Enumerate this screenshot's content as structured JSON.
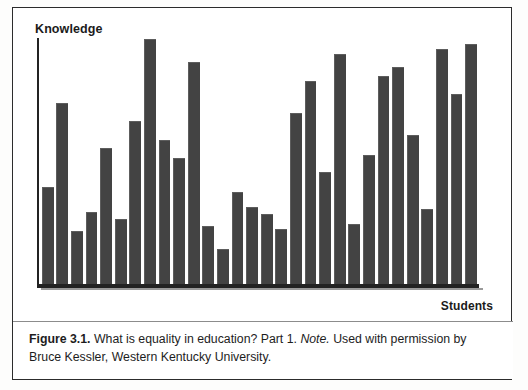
{
  "figure": {
    "caption_label": "Figure 3.1.",
    "caption_main": " What is equality in education? Part 1. ",
    "caption_note_label": "Note.",
    "caption_note_body": " Used with permission by Bruce Kessler, Western Kentucky University."
  },
  "colors": {
    "bar_fill": "#434343",
    "axis": "#232323",
    "frame": "#2c2c2c",
    "background": "#ffffff"
  },
  "chart_data": {
    "type": "bar",
    "title": "",
    "subtitle": "",
    "xlabel": "Students",
    "ylabel": "Knowledge",
    "grid": false,
    "legend": "none",
    "ylim": [
      0,
      100
    ],
    "axis_ticks": "none",
    "categories": [
      "1",
      "2",
      "3",
      "4",
      "5",
      "6",
      "7",
      "8",
      "9",
      "10",
      "11",
      "12",
      "13",
      "14",
      "15",
      "16",
      "17",
      "18",
      "19",
      "20",
      "21",
      "22",
      "23",
      "24",
      "25",
      "26",
      "27",
      "28",
      "29",
      "30"
    ],
    "values": [
      39,
      73,
      21,
      29,
      55,
      26,
      66,
      99,
      58,
      51,
      90,
      23,
      14,
      37,
      31,
      28,
      22,
      69,
      82,
      45,
      93,
      24,
      52,
      84,
      88,
      60,
      30,
      95,
      77,
      97
    ],
    "note": "Irregular bar heights illustrating unequal knowledge across students; no numeric axis ticks are printed on the figure."
  }
}
